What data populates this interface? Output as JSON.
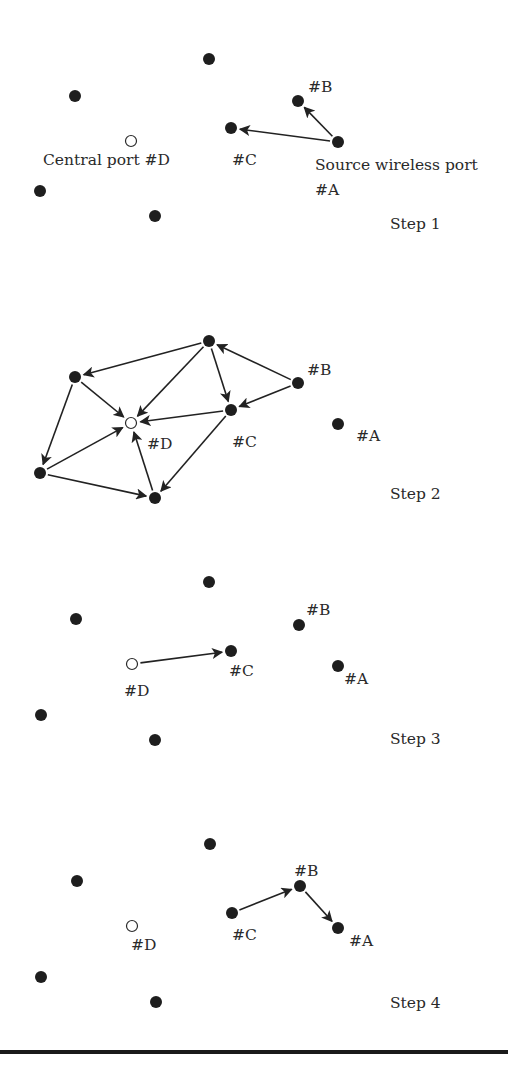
{
  "figure": {
    "colors": {
      "node": "#1e1e1e",
      "edge": "#222222",
      "text": "#2a2a2a",
      "rule": "#1a1a1a"
    },
    "steps": [
      {
        "label": "Step 1",
        "label_pos": [
          390,
          229
        ],
        "nodes": [
          {
            "id": "top",
            "x": 209,
            "y": 59,
            "type": "filled"
          },
          {
            "id": "upper-left",
            "x": 75,
            "y": 96,
            "type": "filled"
          },
          {
            "id": "D",
            "x": 131,
            "y": 141,
            "type": "hollow"
          },
          {
            "id": "lower-left",
            "x": 40,
            "y": 191,
            "type": "filled"
          },
          {
            "id": "bottom",
            "x": 155,
            "y": 216,
            "type": "filled"
          },
          {
            "id": "C",
            "x": 231,
            "y": 128,
            "type": "filled"
          },
          {
            "id": "B",
            "x": 298,
            "y": 101,
            "type": "filled"
          },
          {
            "id": "A",
            "x": 338,
            "y": 142,
            "type": "filled"
          }
        ],
        "labels": [
          {
            "text": "#B",
            "x": 308,
            "y": 92
          },
          {
            "text": "Central port #D",
            "x": 43,
            "y": 165
          },
          {
            "text": "#C",
            "x": 232,
            "y": 165
          },
          {
            "text": "Source wireless port",
            "x": 315,
            "y": 170
          },
          {
            "text": "#A",
            "x": 315,
            "y": 195
          }
        ],
        "edges": [
          {
            "from": "A",
            "to": "B"
          },
          {
            "from": "A",
            "to": "C"
          }
        ]
      },
      {
        "label": "Step 2",
        "label_pos": [
          390,
          499
        ],
        "nodes": [
          {
            "id": "top",
            "x": 209,
            "y": 341,
            "type": "filled"
          },
          {
            "id": "upper-left",
            "x": 75,
            "y": 377,
            "type": "filled"
          },
          {
            "id": "D",
            "x": 131,
            "y": 423,
            "type": "hollow"
          },
          {
            "id": "lower-left",
            "x": 40,
            "y": 473,
            "type": "filled"
          },
          {
            "id": "bottom",
            "x": 155,
            "y": 498,
            "type": "filled"
          },
          {
            "id": "C",
            "x": 231,
            "y": 410,
            "type": "filled"
          },
          {
            "id": "B",
            "x": 298,
            "y": 383,
            "type": "filled"
          },
          {
            "id": "A",
            "x": 338,
            "y": 424,
            "type": "filled"
          }
        ],
        "labels": [
          {
            "text": "#B",
            "x": 307,
            "y": 375
          },
          {
            "text": "#D",
            "x": 147,
            "y": 449
          },
          {
            "text": "#C",
            "x": 232,
            "y": 447
          },
          {
            "text": "#A",
            "x": 356,
            "y": 441
          }
        ],
        "edges": [
          {
            "from": "top",
            "to": "upper-left"
          },
          {
            "from": "top",
            "to": "D"
          },
          {
            "from": "top",
            "to": "C"
          },
          {
            "from": "B",
            "to": "top"
          },
          {
            "from": "B",
            "to": "C"
          },
          {
            "from": "C",
            "to": "D"
          },
          {
            "from": "C",
            "to": "bottom"
          },
          {
            "from": "upper-left",
            "to": "D"
          },
          {
            "from": "upper-left",
            "to": "lower-left"
          },
          {
            "from": "lower-left",
            "to": "D"
          },
          {
            "from": "lower-left",
            "to": "bottom"
          },
          {
            "from": "bottom",
            "to": "D"
          }
        ]
      },
      {
        "label": "Step 3",
        "label_pos": [
          390,
          744
        ],
        "nodes": [
          {
            "id": "top",
            "x": 209,
            "y": 582,
            "type": "filled"
          },
          {
            "id": "upper-left",
            "x": 76,
            "y": 619,
            "type": "filled"
          },
          {
            "id": "D",
            "x": 132,
            "y": 664,
            "type": "hollow"
          },
          {
            "id": "lower-left",
            "x": 41,
            "y": 715,
            "type": "filled"
          },
          {
            "id": "bottom",
            "x": 155,
            "y": 740,
            "type": "filled"
          },
          {
            "id": "C",
            "x": 231,
            "y": 651,
            "type": "filled"
          },
          {
            "id": "B",
            "x": 299,
            "y": 625,
            "type": "filled"
          },
          {
            "id": "A",
            "x": 338,
            "y": 666,
            "type": "filled"
          }
        ],
        "labels": [
          {
            "text": "#B",
            "x": 306,
            "y": 615
          },
          {
            "text": "#D",
            "x": 124,
            "y": 696
          },
          {
            "text": "#C",
            "x": 229,
            "y": 676
          },
          {
            "text": "#A",
            "x": 344,
            "y": 684
          }
        ],
        "edges": [
          {
            "from": "D",
            "to": "C"
          }
        ]
      },
      {
        "label": "Step 4",
        "label_pos": [
          390,
          1008
        ],
        "nodes": [
          {
            "id": "top",
            "x": 210,
            "y": 844,
            "type": "filled"
          },
          {
            "id": "upper-left",
            "x": 77,
            "y": 881,
            "type": "filled"
          },
          {
            "id": "D",
            "x": 132,
            "y": 926,
            "type": "hollow"
          },
          {
            "id": "lower-left",
            "x": 41,
            "y": 977,
            "type": "filled"
          },
          {
            "id": "bottom",
            "x": 156,
            "y": 1002,
            "type": "filled"
          },
          {
            "id": "C",
            "x": 232,
            "y": 913,
            "type": "filled"
          },
          {
            "id": "B",
            "x": 300,
            "y": 886,
            "type": "filled"
          },
          {
            "id": "A",
            "x": 338,
            "y": 928,
            "type": "filled"
          }
        ],
        "labels": [
          {
            "text": "#B",
            "x": 294,
            "y": 876
          },
          {
            "text": "#D",
            "x": 131,
            "y": 950
          },
          {
            "text": "#C",
            "x": 232,
            "y": 940
          },
          {
            "text": "#A",
            "x": 349,
            "y": 946
          }
        ],
        "edges": [
          {
            "from": "C",
            "to": "B"
          },
          {
            "from": "B",
            "to": "A"
          }
        ]
      }
    ]
  }
}
